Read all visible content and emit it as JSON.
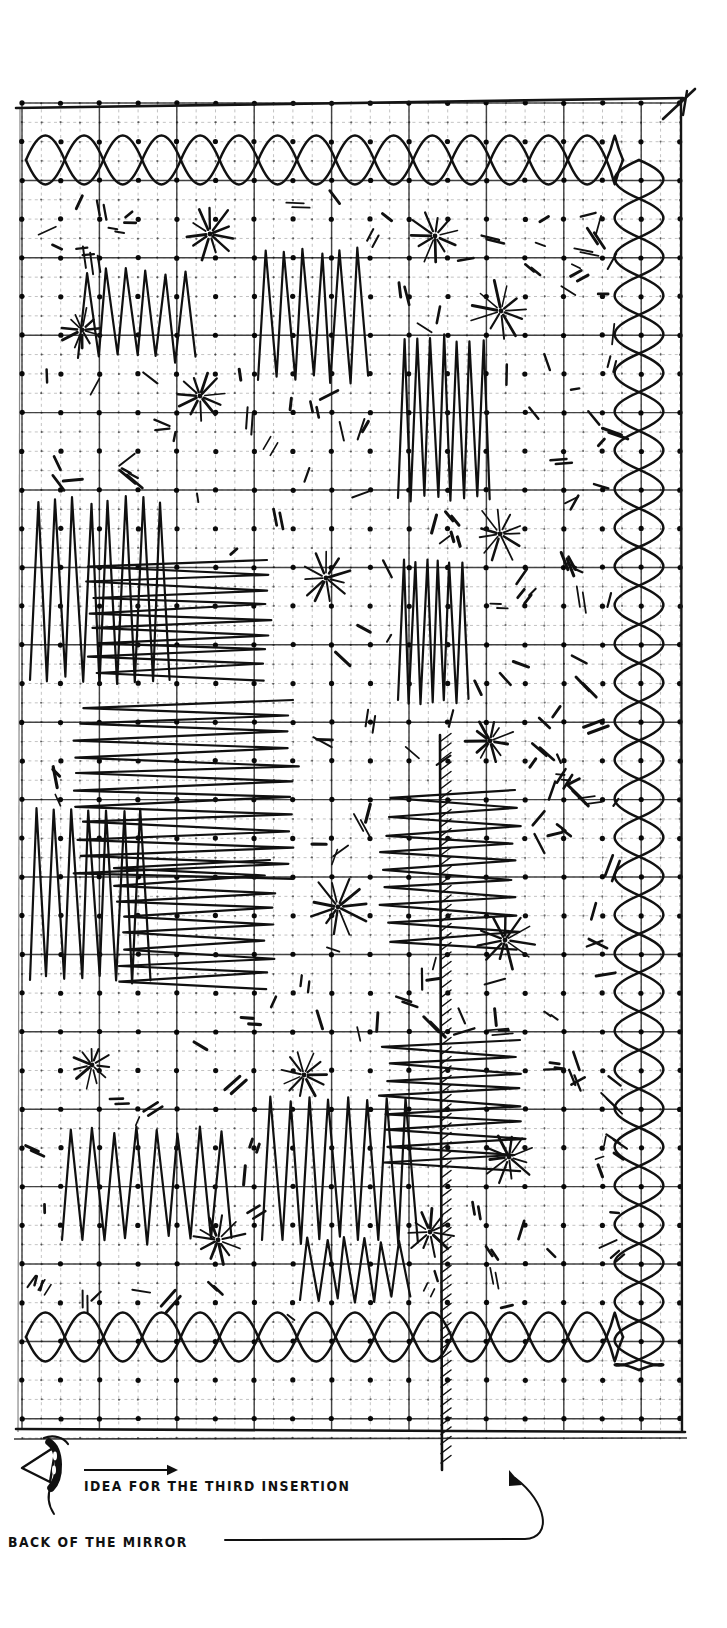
{
  "document": {
    "kind": "embroidery-pattern-chart",
    "medium": "scanned line drawing on graph paper",
    "ink_color": "#101010",
    "paper_color": "#ffffff",
    "grid_line_color": "#4a4a4a",
    "grid_dot_color": "#141414"
  },
  "frame": {
    "left": 22,
    "top": 103,
    "right": 681,
    "bottom": 1430,
    "border_color": "#141414"
  },
  "grid": {
    "dot_spacing_px": 19.35,
    "heavy_line_every_n_cells": 4,
    "heavy_line_color": "#3a3a3a",
    "fine_line_color": "#9a9a9a",
    "fine_line_style": "dashed",
    "dot_radius_px": 2.6
  },
  "captions": [
    {
      "name": "idea-for-third-insertion",
      "text": "IDEA FOR THE THIRD INSERTION"
    },
    {
      "name": "back-of-the-mirror",
      "text": "BACK OF THE MIRROR"
    }
  ],
  "annotations": {
    "direction_arrow": {
      "name": "direction-arrow",
      "description": "horizontal arrow pointing right above the first caption",
      "x1": 84,
      "y1": 1470,
      "x2": 178,
      "y2": 1470
    },
    "leader_line": {
      "name": "mirror-leader-line",
      "description": "long horizontal leader from the BACK OF THE MIRROR caption curving up to the hatched mirror edge",
      "x1": 225,
      "y1": 1540,
      "x2": 525,
      "y2": 1540
    },
    "needle": {
      "name": "needle-and-thread-icon",
      "description": "threaded needle drawn at the lower-left of the chart"
    },
    "corner_tick": {
      "name": "top-right-corner-tick",
      "description": "short diagonal stitch mark crossing the top-right frame corner"
    }
  },
  "motifs": {
    "border_diamond_chain_horizontal": {
      "name": "horizontal-diamond-chain-border",
      "description": "interlaced pointed-oval / diamond chain band running along the top and bottom edges",
      "cells_per_diamond": 4
    },
    "border_diamond_chain_vertical": {
      "name": "vertical-diamond-chain-border",
      "description": "interlaced pointed-oval / diamond chain band running down the right edge",
      "cells_per_diamond": 4
    },
    "zigzag_fill": {
      "name": "zigzag-satin-stitch-fill",
      "description": "dense sawtooth / zigzag stitch blocks filling the interior, both tall-vertical and wide-horizontal orientations"
    },
    "star_burst": {
      "name": "star-burst-stitch",
      "description": "radiating eight-to-twelve ray star stitch worked from a single grid dot",
      "rays": 11
    },
    "seed_stitch": {
      "name": "seed-stitch-mark",
      "description": "scattered short single and paired slanted straight stitches"
    },
    "mirror_edge": {
      "name": "hatched-mirror-edge",
      "description": "vertical line with short right-leaning hatch marks marking the back edge of the mirror",
      "x": 440,
      "y_top": 735,
      "y_bottom": 1470
    }
  },
  "stars": [
    {
      "x": 210,
      "y": 234,
      "r": 26
    },
    {
      "x": 435,
      "y": 236,
      "r": 24
    },
    {
      "x": 501,
      "y": 311,
      "r": 27
    },
    {
      "x": 200,
      "y": 396,
      "r": 22
    },
    {
      "x": 326,
      "y": 578,
      "r": 25
    },
    {
      "x": 500,
      "y": 534,
      "r": 26
    },
    {
      "x": 490,
      "y": 741,
      "r": 22
    },
    {
      "x": 338,
      "y": 907,
      "r": 27
    },
    {
      "x": 505,
      "y": 940,
      "r": 26
    },
    {
      "x": 92,
      "y": 1065,
      "r": 21
    },
    {
      "x": 218,
      "y": 1240,
      "r": 26
    },
    {
      "x": 509,
      "y": 1157,
      "r": 24
    },
    {
      "x": 430,
      "y": 1232,
      "r": 22
    },
    {
      "x": 82,
      "y": 330,
      "r": 20
    },
    {
      "x": 304,
      "y": 1075,
      "r": 24
    }
  ],
  "zigzag_blocks": [
    {
      "name": "vertical-zigzag",
      "x": 78,
      "y": 272,
      "w": 118,
      "h": 86,
      "teeth": 6,
      "orient": "v"
    },
    {
      "name": "vertical-zigzag",
      "x": 258,
      "y": 250,
      "w": 110,
      "h": 130,
      "teeth": 6,
      "orient": "v"
    },
    {
      "name": "vertical-zigzag",
      "x": 398,
      "y": 338,
      "w": 92,
      "h": 160,
      "teeth": 7,
      "orient": "v"
    },
    {
      "name": "vertical-zigzag",
      "x": 30,
      "y": 500,
      "w": 140,
      "h": 180,
      "teeth": 8,
      "orient": "v"
    },
    {
      "name": "horizontal-zigzag",
      "x": 92,
      "y": 560,
      "w": 175,
      "h": 120,
      "teeth": 8,
      "orient": "h"
    },
    {
      "name": "horizontal-zigzag",
      "x": 78,
      "y": 700,
      "w": 215,
      "h": 180,
      "teeth": 11,
      "orient": "h"
    },
    {
      "name": "vertical-zigzag",
      "x": 30,
      "y": 810,
      "w": 120,
      "h": 170,
      "teeth": 7,
      "orient": "v"
    },
    {
      "name": "horizontal-zigzag",
      "x": 120,
      "y": 860,
      "w": 150,
      "h": 130,
      "teeth": 8,
      "orient": "h"
    },
    {
      "name": "vertical-zigzag",
      "x": 398,
      "y": 560,
      "w": 70,
      "h": 140,
      "teeth": 6,
      "orient": "v"
    },
    {
      "name": "horizontal-zigzag",
      "x": 385,
      "y": 790,
      "w": 130,
      "h": 160,
      "teeth": 9,
      "orient": "h"
    },
    {
      "name": "horizontal-zigzag",
      "x": 385,
      "y": 1040,
      "w": 135,
      "h": 130,
      "teeth": 8,
      "orient": "h"
    },
    {
      "name": "vertical-zigzag",
      "x": 62,
      "y": 1130,
      "w": 170,
      "h": 110,
      "teeth": 8,
      "orient": "v"
    },
    {
      "name": "vertical-zigzag",
      "x": 262,
      "y": 1100,
      "w": 155,
      "h": 140,
      "teeth": 8,
      "orient": "v"
    },
    {
      "name": "vertical-zigzag",
      "x": 300,
      "y": 1240,
      "w": 110,
      "h": 60,
      "teeth": 6,
      "orient": "v"
    }
  ]
}
